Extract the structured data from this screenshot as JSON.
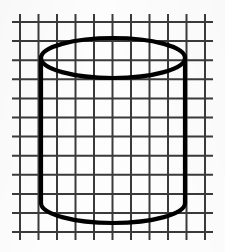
{
  "figure": {
    "title": "Cylinder drawn on graph paper",
    "canvas": {
      "width": 225,
      "height": 252,
      "background": "#fdfdfd"
    },
    "ink_color": "#000000",
    "ink_stroke_width": 4.2,
    "grid_color": "#3a3a3a",
    "grid_stroke_width": 2
  },
  "grid": {
    "name": "square-grid",
    "cell_width": 18.5,
    "cell_height": 19.1,
    "vertical_line_count": 11,
    "horizontal_line_count": 12,
    "vertical_x": [
      20,
      38.5,
      57,
      75.5,
      94,
      112.5,
      131,
      149.5,
      168,
      186.5,
      205
    ],
    "horizontal_y": [
      22,
      41.1,
      60.2,
      79.3,
      98.4,
      117.5,
      136.6,
      155.7,
      174.8,
      193.9,
      213,
      232
    ],
    "vertical_span": {
      "y_start": 14,
      "y_end": 240
    },
    "horizontal_span": {
      "x_start": 12,
      "x_end": 213
    }
  },
  "cylinder": {
    "name": "cylinder",
    "center_x": 113,
    "radius_x": 72,
    "top_ellipse": {
      "name": "top-face-ellipse",
      "center_y": 58,
      "radius_y": 20,
      "top_y": 38,
      "bottom_y": 78,
      "visible": "full"
    },
    "bottom_ellipse": {
      "name": "bottom-face-arc",
      "center_y": 203,
      "radius_y": 20,
      "bottom_y": 223,
      "visible": "front-arc-only"
    },
    "left_side": {
      "name": "left-silhouette-edge",
      "x": 41,
      "y_top": 58,
      "y_bottom": 203
    },
    "right_side": {
      "name": "right-silhouette-edge",
      "x": 185,
      "y_top": 58,
      "y_bottom": 203
    }
  }
}
